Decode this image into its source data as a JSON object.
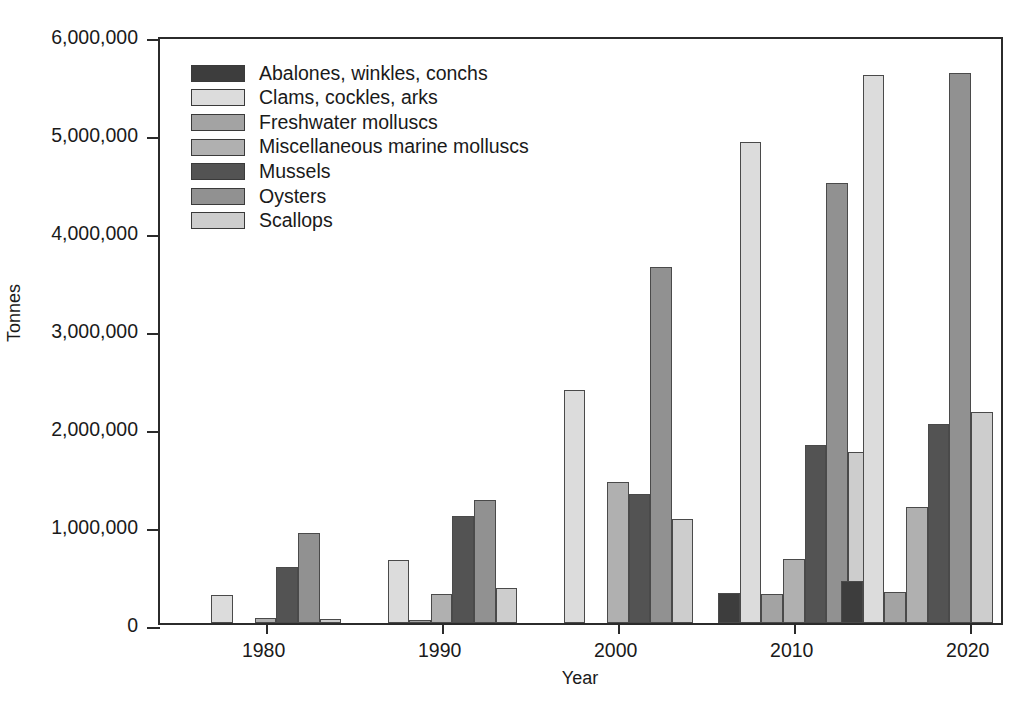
{
  "chart_data": {
    "type": "bar",
    "title": "",
    "xlabel": "Year",
    "ylabel": "Tonnes",
    "xlim": [
      1974,
      2022
    ],
    "ylim": [
      0,
      6000000
    ],
    "xticks": [
      1980,
      1990,
      2000,
      2010,
      2020
    ],
    "xtick_labels": [
      "1980",
      "1990",
      "2000",
      "2010",
      "2020"
    ],
    "yticks": [
      0,
      1000000,
      2000000,
      3000000,
      4000000,
      5000000,
      6000000
    ],
    "ytick_labels": [
      "0",
      "1,000,000",
      "2,000,000",
      "3,000,000",
      "4,000,000",
      "5,000,000",
      "6,000,000"
    ],
    "grid": false,
    "legend_position": "upper left",
    "group_centers": [
      1980,
      1990,
      2000,
      2010,
      2017
    ],
    "categories": [
      "1980",
      "1990",
      "2000",
      "2010",
      "2017"
    ],
    "series": [
      {
        "name": "Abalones, winkles, conchs",
        "color": "#3d3d3d",
        "values": [
          0,
          0,
          0,
          305000,
          425000
        ]
      },
      {
        "name": "Clams, cockles, arks",
        "color": "#dcdcdc",
        "values": [
          285000,
          640000,
          2375000,
          4910000,
          5590000
        ]
      },
      {
        "name": "Freshwater molluscs",
        "color": "#a3a3a3",
        "values": [
          0,
          30000,
          0,
          300000,
          315000
        ]
      },
      {
        "name": "Miscellaneous marine molluscs",
        "color": "#b0b0b0",
        "values": [
          55000,
          295000,
          1435000,
          655000,
          1180000
        ]
      },
      {
        "name": "Mussels",
        "color": "#535353",
        "values": [
          570000,
          1090000,
          1320000,
          1815000,
          2035000
        ]
      },
      {
        "name": "Oysters",
        "color": "#919191",
        "values": [
          915000,
          1255000,
          3635000,
          4495000,
          5615000
        ]
      },
      {
        "name": "Scallops",
        "color": "#cdcdcd",
        "values": [
          45000,
          360000,
          1065000,
          1745000,
          2155000
        ]
      }
    ]
  },
  "axes": {
    "y_title": "Tonnes",
    "x_title": "Year"
  },
  "legend": {
    "items": [
      {
        "label": "Abalones, winkles, conchs"
      },
      {
        "label": "Clams, cockles, arks"
      },
      {
        "label": "Freshwater molluscs"
      },
      {
        "label": "Miscellaneous marine molluscs"
      },
      {
        "label": "Mussels"
      },
      {
        "label": "Oysters"
      },
      {
        "label": "Scallops"
      }
    ]
  }
}
